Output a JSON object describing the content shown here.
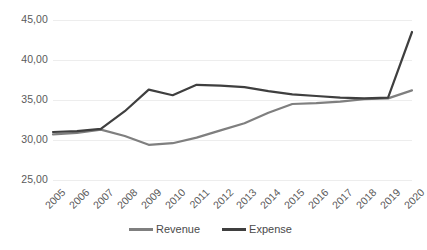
{
  "chart_data": {
    "type": "line",
    "title": "",
    "xlabel": "",
    "ylabel": "",
    "categories": [
      "2005",
      "2006",
      "2007",
      "2008",
      "2009",
      "2010",
      "2011",
      "2012",
      "2013",
      "2014",
      "2015",
      "2016",
      "2017",
      "2018",
      "2019",
      "2020"
    ],
    "ylim": [
      25.0,
      45.0
    ],
    "yticks": [
      "25,00",
      "30,00",
      "35,00",
      "40,00",
      "45,00"
    ],
    "ytick_values": [
      25.0,
      30.0,
      35.0,
      40.0,
      45.0
    ],
    "grid": true,
    "legend_position": "bottom",
    "series": [
      {
        "name": "Revenue",
        "color": "#7f7f7f",
        "values": [
          30.7,
          30.9,
          31.3,
          30.5,
          29.4,
          29.6,
          30.3,
          31.2,
          32.1,
          33.4,
          34.5,
          34.6,
          34.8,
          35.1,
          35.2,
          36.2
        ]
      },
      {
        "name": "Expense",
        "color": "#3f3f3f",
        "values": [
          31.0,
          31.1,
          31.4,
          33.6,
          36.3,
          35.6,
          36.9,
          36.8,
          36.6,
          36.1,
          35.7,
          35.5,
          35.3,
          35.2,
          35.3,
          43.5
        ]
      }
    ]
  },
  "legend": {
    "items": [
      {
        "label": "Revenue",
        "color": "#7f7f7f"
      },
      {
        "label": "Expense",
        "color": "#3f3f3f"
      }
    ]
  },
  "colors": {
    "grid": "#ededed",
    "tick_text": "#5a5a5a",
    "background": "#ffffff"
  }
}
